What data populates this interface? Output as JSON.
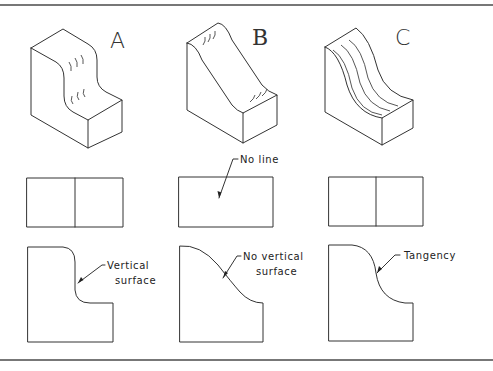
{
  "figure": {
    "columns": [
      {
        "id": "A",
        "label": "A",
        "description": "Rounded step with vertical surface",
        "top_view": "two rectangles with dividing line",
        "front_view": {
          "callout_lines": [
            "Vertical",
            "surface"
          ]
        }
      },
      {
        "id": "B",
        "label": "B",
        "description": "Smooth S-curve with no vertical surface",
        "top_view": {
          "callout_lines": [
            "No line"
          ]
        },
        "front_view": {
          "callout_lines": [
            "No vertical",
            "surface"
          ]
        }
      },
      {
        "id": "C",
        "label": "C",
        "description": "Curves meeting at tangency",
        "top_view": "two rectangles with dividing line",
        "front_view": {
          "callout_lines": [
            "Tangency"
          ]
        }
      }
    ]
  },
  "colors": {
    "line": "#333333",
    "rule": "#777777",
    "background": "#ffffff"
  }
}
